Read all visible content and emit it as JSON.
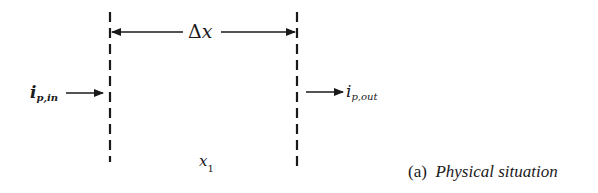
{
  "diagram": {
    "type": "control-volume",
    "width_label_symbol": "Δ",
    "width_label_var": "x",
    "position_label_var": "x",
    "position_label_sub": "1",
    "inflow": {
      "var": "i",
      "sub": "p,in"
    },
    "outflow": {
      "var": "i",
      "sub": "p,out"
    },
    "caption_prefix": "(a)",
    "caption_text": "Physical situation",
    "line_color": "#1a1a1a"
  }
}
